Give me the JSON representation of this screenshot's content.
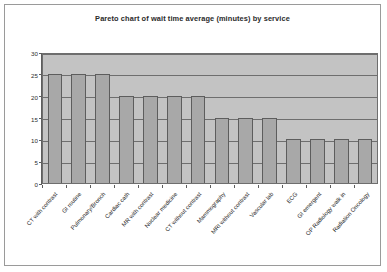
{
  "chart_data": {
    "type": "bar",
    "title": "Pareto chart of wait time average (minutes) by service",
    "xlabel": "",
    "ylabel": "",
    "ylim": [
      0,
      30
    ],
    "yticks": [
      0,
      5,
      10,
      15,
      20,
      25,
      30
    ],
    "grid": true,
    "legend": null,
    "categories": [
      "CT with contrast",
      "GI routine",
      "Pulmonary/Bronch",
      "Cardiac cath",
      "MR with contrast",
      "Nuclear medicine",
      "CT without contrast",
      "Mammography",
      "MRI without contrast",
      "Vascular lab",
      "ECG",
      "GI emergent",
      "OP Radiology walk in",
      "Radiation Oncology"
    ],
    "values": [
      25,
      25,
      25,
      20,
      20,
      20,
      20,
      15,
      15,
      15,
      10,
      10,
      10,
      10
    ],
    "colors": {
      "bar_fill": "#a8a8a8",
      "bar_edge": "#5d5d5d",
      "plot_background": "#c3c3c3",
      "gridline": "#6e6e6e",
      "page_background": "#ffffff",
      "frame": "#9a9a9a",
      "text": "#262626"
    }
  }
}
